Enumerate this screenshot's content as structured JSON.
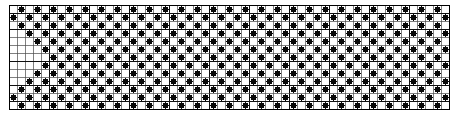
{
  "figure": {
    "name": "pattern-chart"
  },
  "chart_data": {
    "type": "heatmap",
    "title": "",
    "subtitle": "",
    "xlabel": "",
    "ylabel": "",
    "categories": [],
    "values": [],
    "grid": {
      "columns": 55,
      "rows": 13,
      "cell_size_px": 8,
      "origin_x_px": 9,
      "origin_y_px": 5,
      "minor_line_color": "#4a4a4a",
      "major_line_color": "#101010",
      "major_every_columns": 5,
      "major_row_indices": [
        0,
        1,
        3,
        7,
        10,
        12,
        13
      ],
      "border_color": "#000000",
      "grid_on": true
    },
    "marker": {
      "shape": "circle",
      "color": "#080808",
      "diameter_px": 6.2,
      "legend_label": ""
    },
    "legend": {
      "entries": [],
      "position": "none"
    },
    "xlim": [
      0,
      55
    ],
    "ylim": [
      0,
      13
    ],
    "annotations": [],
    "filled_cells_rows": [
      [
        1,
        3,
        5,
        7,
        9,
        11,
        13,
        15,
        17,
        19,
        21,
        23,
        25,
        27,
        29,
        31,
        33,
        35,
        37,
        39,
        41,
        43,
        45,
        47,
        49,
        51,
        53
      ],
      [
        0,
        2,
        4,
        6,
        8,
        10,
        12,
        14,
        16,
        18,
        20,
        22,
        24,
        26,
        28,
        30,
        32,
        34,
        36,
        38,
        40,
        42,
        44,
        46,
        48,
        50,
        52,
        54
      ],
      [
        1,
        3,
        5,
        7,
        9,
        11,
        13,
        15,
        17,
        19,
        21,
        23,
        25,
        27,
        29,
        31,
        33,
        35,
        37,
        39,
        41,
        43,
        45,
        47,
        49,
        51,
        53
      ],
      [
        2,
        4,
        6,
        8,
        10,
        12,
        14,
        16,
        18,
        20,
        22,
        24,
        26,
        28,
        30,
        32,
        34,
        36,
        38,
        40,
        42,
        44,
        46,
        48,
        50,
        52,
        54
      ],
      [
        3,
        5,
        7,
        9,
        11,
        13,
        15,
        17,
        19,
        21,
        23,
        25,
        27,
        29,
        31,
        33,
        35,
        37,
        39,
        41,
        43,
        45,
        47,
        49,
        51,
        53
      ],
      [
        4,
        6,
        8,
        10,
        12,
        14,
        16,
        18,
        20,
        22,
        24,
        26,
        28,
        30,
        32,
        34,
        36,
        38,
        40,
        42,
        44,
        46,
        48,
        50,
        52,
        54
      ],
      [
        5,
        7,
        9,
        11,
        13,
        15,
        17,
        19,
        21,
        23,
        25,
        27,
        29,
        31,
        33,
        35,
        37,
        39,
        41,
        43,
        45,
        47,
        49,
        51,
        53
      ],
      [
        4,
        6,
        8,
        10,
        12,
        14,
        16,
        18,
        20,
        22,
        24,
        26,
        28,
        30,
        32,
        34,
        36,
        38,
        40,
        42,
        44,
        46,
        48,
        50,
        52,
        54
      ],
      [
        3,
        5,
        7,
        9,
        11,
        13,
        15,
        17,
        19,
        21,
        23,
        25,
        27,
        29,
        31,
        33,
        35,
        37,
        39,
        41,
        43,
        45,
        47,
        49,
        51,
        53
      ],
      [
        2,
        4,
        6,
        8,
        10,
        12,
        14,
        16,
        18,
        20,
        22,
        24,
        26,
        28,
        30,
        32,
        34,
        36,
        38,
        40,
        42,
        44,
        46,
        48,
        50,
        52,
        54
      ],
      [
        1,
        3,
        5,
        7,
        9,
        11,
        13,
        15,
        17,
        19,
        21,
        23,
        25,
        27,
        29,
        31,
        33,
        35,
        37,
        39,
        41,
        43,
        45,
        47,
        49,
        51,
        53
      ],
      [
        0,
        2,
        4,
        6,
        8,
        10,
        12,
        14,
        16,
        18,
        20,
        22,
        24,
        26,
        28,
        30,
        32,
        34,
        36,
        38,
        40,
        42,
        44,
        46,
        48,
        50,
        52,
        54
      ],
      [
        1,
        3,
        5,
        7,
        9,
        11,
        13,
        15,
        17,
        19,
        21,
        23,
        25,
        27,
        29,
        31,
        33,
        35,
        37,
        39,
        41,
        43,
        45,
        47,
        49,
        51,
        53
      ]
    ],
    "motif_repeat": {
      "period_columns": 14,
      "motifs": [
        "cross",
        "star",
        "cross",
        "star"
      ],
      "count_visible": 4
    }
  }
}
